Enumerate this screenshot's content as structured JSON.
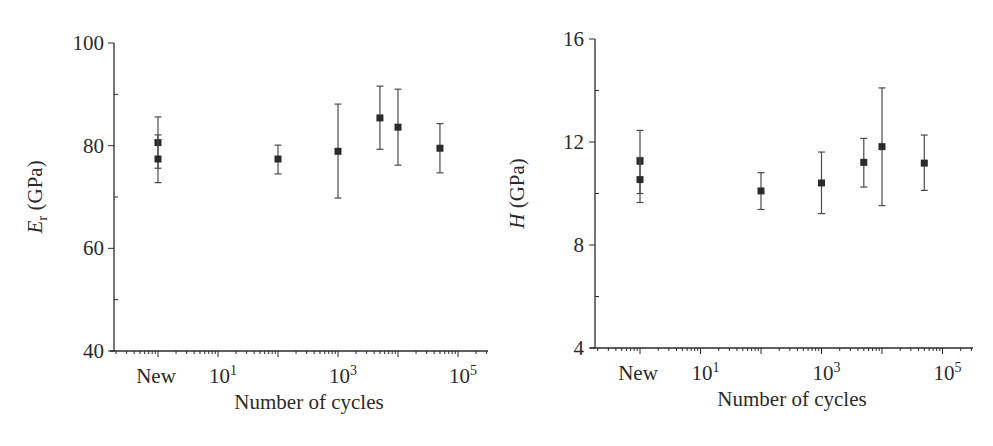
{
  "chart_data": [
    {
      "type": "scatter",
      "id": "modulus",
      "title": "",
      "xlabel": "Number of cycles",
      "ylabel_main": "E",
      "ylabel_sub": "r",
      "ylabel_unit": " (GPa)",
      "xscale": "log",
      "xlim_log10": [
        -0.8,
        5.5
      ],
      "ylim": [
        40,
        100
      ],
      "yticks": [
        40,
        60,
        80,
        100
      ],
      "yticks_minor": [
        50,
        70,
        90
      ],
      "xtick_labels": [
        {
          "log10": 0,
          "text": "New",
          "sup": ""
        },
        {
          "log10": 1,
          "text": "10",
          "sup": "1"
        },
        {
          "log10": 3,
          "text": "10",
          "sup": "3"
        },
        {
          "log10": 5,
          "text": "10",
          "sup": "5"
        }
      ],
      "grid": false,
      "legend": "none",
      "points": [
        {
          "x_label": "New",
          "x": 1,
          "y": 80.6,
          "y_low": 75.6,
          "y_high": 85.6
        },
        {
          "x_label": "New",
          "x": 1,
          "y": 77.4,
          "y_low": 72.8,
          "y_high": 82.1
        },
        {
          "x": 100,
          "y": 77.4,
          "y_low": 74.5,
          "y_high": 80.1
        },
        {
          "x": 1000,
          "y": 78.9,
          "y_low": 69.8,
          "y_high": 88.1
        },
        {
          "x": 5000,
          "y": 85.4,
          "y_low": 79.3,
          "y_high": 91.6
        },
        {
          "x": 10000,
          "y": 83.6,
          "y_low": 76.2,
          "y_high": 91.0
        },
        {
          "x": 50000,
          "y": 79.5,
          "y_low": 74.7,
          "y_high": 84.3
        }
      ]
    },
    {
      "type": "scatter",
      "id": "hardness",
      "title": "",
      "xlabel": "Number of cycles",
      "ylabel_main": "H",
      "ylabel_sub": "",
      "ylabel_unit": " (GPa)",
      "xscale": "log",
      "xlim_log10": [
        -0.8,
        5.5
      ],
      "ylim": [
        4,
        16
      ],
      "yticks": [
        4,
        8,
        12,
        16
      ],
      "yticks_minor": [
        6,
        10,
        14
      ],
      "xtick_labels": [
        {
          "log10": 0,
          "text": "New",
          "sup": ""
        },
        {
          "log10": 1,
          "text": "10",
          "sup": "1"
        },
        {
          "log10": 3,
          "text": "10",
          "sup": "3"
        },
        {
          "log10": 5,
          "text": "10",
          "sup": "5"
        }
      ],
      "grid": false,
      "legend": "none",
      "points": [
        {
          "x_label": "New",
          "x": 1,
          "y": 11.25,
          "y_low": 10.0,
          "y_high": 12.45
        },
        {
          "x_label": "New",
          "x": 1,
          "y": 10.54,
          "y_low": 9.65,
          "y_high": 11.4
        },
        {
          "x": 100,
          "y": 10.1,
          "y_low": 9.38,
          "y_high": 10.81
        },
        {
          "x": 1000,
          "y": 10.41,
          "y_low": 9.22,
          "y_high": 11.61
        },
        {
          "x": 5000,
          "y": 11.21,
          "y_low": 10.25,
          "y_high": 12.14
        },
        {
          "x": 10000,
          "y": 11.82,
          "y_low": 9.53,
          "y_high": 14.1
        },
        {
          "x": 50000,
          "y": 11.18,
          "y_low": 10.12,
          "y_high": 12.27
        }
      ]
    }
  ]
}
